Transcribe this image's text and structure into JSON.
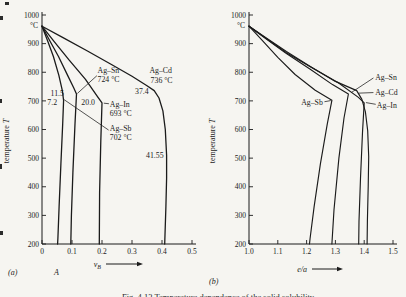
{
  "colors": {
    "paper": "#f6f5f1",
    "ink": "#1b1b1b"
  },
  "figure": {
    "panel_a_label": "(a)",
    "panel_b_label": "(b)",
    "component_label": "A",
    "caption": "Fig. 4.13 Temperature dependence of the solid solubility"
  },
  "chart_data": [
    {
      "type": "line",
      "panel": "a",
      "xlabel": {
        "base": "v",
        "sub": "B"
      },
      "ylabel": "temperature T",
      "y_unit": "°C",
      "xlim": [
        0,
        0.5
      ],
      "ylim": [
        200,
        1000
      ],
      "x_tick_labels": [
        "0",
        "0.1",
        "0.2",
        "0.3",
        "0.4",
        "0.5"
      ],
      "y_tick_values": [
        1000,
        900,
        800,
        700,
        600,
        500,
        400,
        300,
        200
      ],
      "grid": false,
      "series": [
        {
          "name": "Ag-Sb",
          "points": [
            [
              0,
              961
            ],
            [
              0.018,
              912
            ],
            [
              0.038,
              855
            ],
            [
              0.056,
              790
            ],
            [
              0.068,
              735
            ],
            [
              0.072,
              702
            ],
            [
              0.069,
              620
            ],
            [
              0.063,
              480
            ],
            [
              0.057,
              330
            ],
            [
              0.053,
              220
            ],
            [
              0.052,
              200
            ]
          ]
        },
        {
          "name": "Ag-Sn",
          "points": [
            [
              0,
              961
            ],
            [
              0.025,
              912
            ],
            [
              0.055,
              855
            ],
            [
              0.085,
              790
            ],
            [
              0.106,
              745
            ],
            [
              0.115,
              724
            ],
            [
              0.11,
              620
            ],
            [
              0.103,
              450
            ],
            [
              0.098,
              300
            ],
            [
              0.096,
              200
            ]
          ]
        },
        {
          "name": "Ag-In",
          "points": [
            [
              0,
              961
            ],
            [
              0.04,
              908
            ],
            [
              0.09,
              843
            ],
            [
              0.145,
              775
            ],
            [
              0.185,
              715
            ],
            [
              0.2,
              693
            ],
            [
              0.196,
              560
            ],
            [
              0.192,
              380
            ],
            [
              0.191,
              200
            ]
          ]
        },
        {
          "name": "Ag-Cd",
          "points": [
            [
              0,
              961
            ],
            [
              0.07,
              921
            ],
            [
              0.15,
              875
            ],
            [
              0.23,
              828
            ],
            [
              0.3,
              786
            ],
            [
              0.35,
              753
            ],
            [
              0.374,
              736
            ],
            [
              0.39,
              710
            ],
            [
              0.403,
              665
            ],
            [
              0.411,
              600
            ],
            [
              0.4155,
              510
            ],
            [
              0.4155,
              430
            ],
            [
              0.413,
              330
            ],
            [
              0.409,
              200
            ]
          ]
        }
      ],
      "annotations": [
        {
          "text": "Ag–Sn",
          "x": 0.185,
          "y": 806,
          "anchor": "start"
        },
        {
          "text": "724 °C",
          "x": 0.185,
          "y": 776,
          "anchor": "start"
        },
        {
          "text": "Ag–Cd",
          "x": 0.358,
          "y": 806,
          "anchor": "start"
        },
        {
          "text": "736 °C",
          "x": 0.362,
          "y": 772,
          "anchor": "start"
        },
        {
          "text": "37.4",
          "x": 0.333,
          "y": 732,
          "anchor": "middle"
        },
        {
          "text": "11.5",
          "x": 0.051,
          "y": 727,
          "anchor": "middle"
        },
        {
          "text": "7.2",
          "x": 0.034,
          "y": 696,
          "anchor": "middle"
        },
        {
          "text": "20.0",
          "x": 0.154,
          "y": 694,
          "anchor": "middle"
        },
        {
          "text": "Ag–In",
          "x": 0.226,
          "y": 689,
          "anchor": "start"
        },
        {
          "text": "693 °C",
          "x": 0.226,
          "y": 658,
          "anchor": "start"
        },
        {
          "text": "Ag–Sb",
          "x": 0.226,
          "y": 604,
          "anchor": "start"
        },
        {
          "text": "702 °C",
          "x": 0.226,
          "y": 572,
          "anchor": "start"
        },
        {
          "text": "41.55",
          "x": 0.376,
          "y": 510,
          "anchor": "middle"
        }
      ],
      "leaders": [
        [
          0.183,
          788,
          0.118,
          726
        ],
        [
          0.222,
          598,
          0.074,
          704
        ],
        [
          0.206,
          692,
          0.223,
          690
        ]
      ]
    },
    {
      "type": "line",
      "panel": "b",
      "xlabel": {
        "base": "e/a",
        "sub": ""
      },
      "ylabel": "temperature T",
      "y_unit": "°C",
      "xlim": [
        1.0,
        1.5
      ],
      "ylim": [
        200,
        1000
      ],
      "x_tick_labels": [
        "1.0",
        "1.1",
        "1.2",
        "1.3",
        "1.4",
        "1.5"
      ],
      "y_tick_values": [
        1000,
        900,
        800,
        700,
        600,
        500,
        400,
        300,
        200
      ],
      "grid": false,
      "series": [
        {
          "name": "Ag-Sb",
          "points": [
            [
              1.0,
              961
            ],
            [
              1.045,
              912
            ],
            [
              1.1,
              852
            ],
            [
              1.16,
              792
            ],
            [
              1.23,
              737
            ],
            [
              1.288,
              702
            ],
            [
              1.272,
              620
            ],
            [
              1.248,
              480
            ],
            [
              1.226,
              330
            ],
            [
              1.212,
              220
            ],
            [
              1.21,
              200
            ]
          ]
        },
        {
          "name": "Ag-Sn",
          "points": [
            [
              1.0,
              961
            ],
            [
              1.06,
              916
            ],
            [
              1.13,
              865
            ],
            [
              1.21,
              812
            ],
            [
              1.29,
              757
            ],
            [
              1.345,
              724
            ],
            [
              1.33,
              640
            ],
            [
              1.312,
              500
            ],
            [
              1.295,
              320
            ],
            [
              1.288,
              200
            ]
          ]
        },
        {
          "name": "Ag-Cd",
          "points": [
            [
              1.0,
              961
            ],
            [
              1.06,
              920
            ],
            [
              1.13,
              872
            ],
            [
              1.21,
              822
            ],
            [
              1.3,
              768
            ],
            [
              1.36,
              742
            ],
            [
              1.374,
              736
            ],
            [
              1.392,
              705
            ],
            [
              1.404,
              662
            ],
            [
              1.412,
              595
            ],
            [
              1.4155,
              505
            ],
            [
              1.414,
              400
            ],
            [
              1.411,
              280
            ],
            [
              1.41,
              200
            ]
          ]
        },
        {
          "name": "Ag-In",
          "points": [
            [
              1.0,
              961
            ],
            [
              1.06,
              918
            ],
            [
              1.13,
              868
            ],
            [
              1.22,
              815
            ],
            [
              1.31,
              763
            ],
            [
              1.38,
              712
            ],
            [
              1.4,
              693
            ],
            [
              1.394,
              590
            ],
            [
              1.387,
              430
            ],
            [
              1.382,
              280
            ],
            [
              1.381,
              200
            ]
          ]
        }
      ],
      "annotations": [
        {
          "text": "Ag–Sb",
          "x": 1.181,
          "y": 694,
          "anchor": "start"
        },
        {
          "text": "Ag–Sn",
          "x": 1.438,
          "y": 783,
          "anchor": "start"
        },
        {
          "text": "Ag–Cd",
          "x": 1.438,
          "y": 731,
          "anchor": "start"
        },
        {
          "text": "Ag–In",
          "x": 1.444,
          "y": 686,
          "anchor": "start"
        }
      ],
      "leaders": [
        [
          1.262,
          697,
          1.284,
          701
        ],
        [
          1.432,
          780,
          1.355,
          729
        ],
        [
          1.432,
          729,
          1.381,
          727
        ],
        [
          1.44,
          688,
          1.406,
          694
        ]
      ]
    }
  ]
}
